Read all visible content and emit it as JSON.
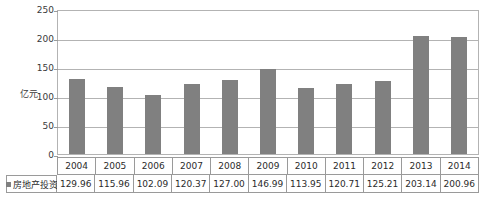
{
  "chart_data": {
    "type": "bar",
    "title": "",
    "xlabel": "",
    "ylabel": "亿元",
    "ylim": [
      0,
      250
    ],
    "yticks": [
      250,
      200,
      150,
      100,
      50,
      0
    ],
    "grid": true,
    "legend_position": "bottom-left-table",
    "categories": [
      "2004",
      "2005",
      "2006",
      "2007",
      "2008",
      "2009",
      "2010",
      "2011",
      "2012",
      "2013",
      "2014"
    ],
    "series": [
      {
        "name": "房地产投资",
        "color": "#808080",
        "values": [
          129.96,
          115.96,
          102.09,
          120.37,
          127.0,
          146.99,
          113.95,
          120.71,
          125.21,
          203.14,
          200.96
        ]
      }
    ]
  },
  "table": {
    "legend_label": "房地产投资",
    "years": [
      "2004",
      "2005",
      "2006",
      "2007",
      "2008",
      "2009",
      "2010",
      "2011",
      "2012",
      "2013",
      "2014"
    ],
    "values": [
      "129.96",
      "115.96",
      "102.09",
      "120.37",
      "127.00",
      "146.99",
      "113.95",
      "120.71",
      "125.21",
      "203.14",
      "200.96"
    ]
  },
  "axis": {
    "unit_label": "亿元",
    "ticks": [
      "250",
      "200",
      "150",
      "100",
      "50",
      "0"
    ]
  }
}
